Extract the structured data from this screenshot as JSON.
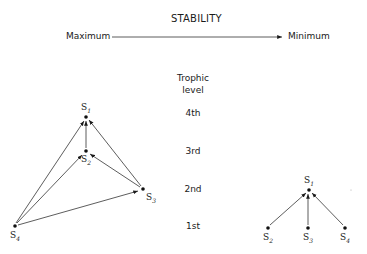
{
  "header": {
    "title": "STABILITY",
    "scale_left": "Maximum",
    "scale_right": "Minimum"
  },
  "trophic": {
    "heading_line1": "Trophic",
    "heading_line2": "level",
    "levels": [
      "4th",
      "3rd",
      "2nd",
      "1st"
    ]
  },
  "left_web": {
    "nodes": [
      {
        "id": "S1",
        "label": "S",
        "sub": "1",
        "x": 86,
        "y": 117
      },
      {
        "id": "S2",
        "label": "S",
        "sub": "2",
        "x": 86,
        "y": 151
      },
      {
        "id": "S3",
        "label": "S",
        "sub": "3",
        "x": 143,
        "y": 189
      },
      {
        "id": "S4",
        "label": "S",
        "sub": "4",
        "x": 15,
        "y": 226
      }
    ],
    "edges": [
      {
        "from": "S2",
        "to": "S1"
      },
      {
        "from": "S3",
        "to": "S1"
      },
      {
        "from": "S4",
        "to": "S1"
      },
      {
        "from": "S3",
        "to": "S2"
      },
      {
        "from": "S4",
        "to": "S2"
      },
      {
        "from": "S4",
        "to": "S3"
      }
    ]
  },
  "right_web": {
    "nodes": [
      {
        "id": "S1",
        "label": "S",
        "sub": "1",
        "x": 309,
        "y": 190
      },
      {
        "id": "S2",
        "label": "S",
        "sub": "2",
        "x": 268,
        "y": 228
      },
      {
        "id": "S3",
        "label": "S",
        "sub": "3",
        "x": 308,
        "y": 228
      },
      {
        "id": "S4",
        "label": "S",
        "sub": "4",
        "x": 345,
        "y": 228
      }
    ],
    "edges": [
      {
        "from": "S2",
        "to": "S1"
      },
      {
        "from": "S3",
        "to": "S1"
      },
      {
        "from": "S4",
        "to": "S1"
      }
    ]
  }
}
